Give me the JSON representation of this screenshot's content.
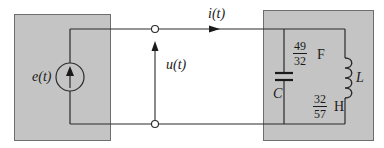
{
  "diagram": {
    "type": "circuit",
    "colors": {
      "box_fill": "#c4c4c4",
      "box_border": "#6e6e6e",
      "wire": "#2a2a2a",
      "background": "#ffffff"
    },
    "source": {
      "label": "e(t)",
      "kind": "current-source",
      "arrow": "up"
    },
    "port": {
      "voltage_label": "u(t)",
      "current_label": "i(t)",
      "terminals": 2
    },
    "load": {
      "capacitor": {
        "symbol": "C",
        "value_num": "49",
        "value_den": "32",
        "unit": "F"
      },
      "inductor": {
        "symbol": "L",
        "value_num": "32",
        "value_den": "57",
        "unit": "H"
      }
    }
  }
}
